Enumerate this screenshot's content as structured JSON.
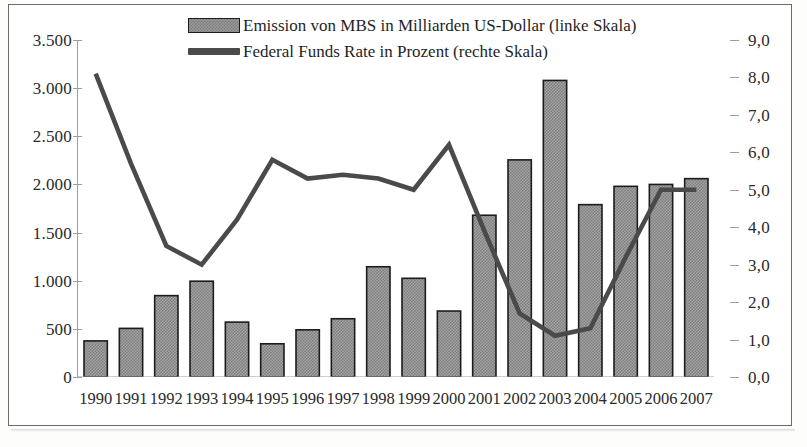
{
  "legend": {
    "position": "top-center",
    "entries": [
      {
        "icon": "bar-swatch-icon",
        "label": "Emission von MBS in Milliarden US-Dollar (linke Skala)"
      },
      {
        "icon": "line-swatch-icon",
        "label": "Federal Funds Rate in Prozent (rechte Skala)"
      }
    ]
  },
  "colors": {
    "bar_fill": "#9a9a9a",
    "bar_edge": "#1c1c1c",
    "line": "#4a4a4a",
    "axis": "#9e9e9e",
    "text": "#1f1f1f",
    "frame": "#6b6b6b"
  },
  "axes": {
    "left": {
      "ticks": [
        "0",
        "500",
        "1.000",
        "1.500",
        "2.000",
        "2.500",
        "3.000",
        "3.500"
      ],
      "min": 0,
      "max": 3500,
      "step": 500
    },
    "right": {
      "ticks": [
        "0,0",
        "1,0",
        "2,0",
        "3,0",
        "4,0",
        "5,0",
        "6,0",
        "7,0",
        "8,0",
        "9,0"
      ],
      "min": 0,
      "max": 9,
      "step": 1
    },
    "x": {
      "ticks": [
        "1990",
        "1991",
        "1992",
        "1993",
        "1994",
        "1995",
        "1996",
        "1997",
        "1998",
        "1999",
        "2000",
        "2001",
        "2002",
        "2003",
        "2004",
        "2005",
        "2006",
        "2007"
      ]
    }
  },
  "chart_data": {
    "type": "bar",
    "title": "",
    "subtitle": "",
    "xlabel": "",
    "ylabel": "Emission von MBS in Milliarden US-Dollar",
    "ylabel_secondary": "Federal Funds Rate in Prozent",
    "grid": false,
    "legend_position": "top-center",
    "categories": [
      "1990",
      "1991",
      "1992",
      "1993",
      "1994",
      "1995",
      "1996",
      "1997",
      "1998",
      "1999",
      "2000",
      "2001",
      "2002",
      "2003",
      "2004",
      "2005",
      "2006",
      "2007"
    ],
    "ylim": [
      0,
      3500
    ],
    "ylim_secondary": [
      0,
      9
    ],
    "series": [
      {
        "name": "Emission von MBS in Milliarden US-Dollar (linke Skala)",
        "type": "bar",
        "axis": "left",
        "values": [
          375,
          505,
          845,
          995,
          570,
          345,
          490,
          605,
          1145,
          1025,
          685,
          1680,
          2255,
          3080,
          1790,
          1980,
          2000,
          2060
        ]
      },
      {
        "name": "Federal Funds Rate in Prozent (rechte Skala)",
        "type": "line",
        "axis": "right",
        "values": [
          8.1,
          5.7,
          3.5,
          3.0,
          4.2,
          5.8,
          5.3,
          5.4,
          5.3,
          5.0,
          6.2,
          3.9,
          1.7,
          1.1,
          1.3,
          3.2,
          5.0,
          5.0
        ]
      }
    ]
  }
}
